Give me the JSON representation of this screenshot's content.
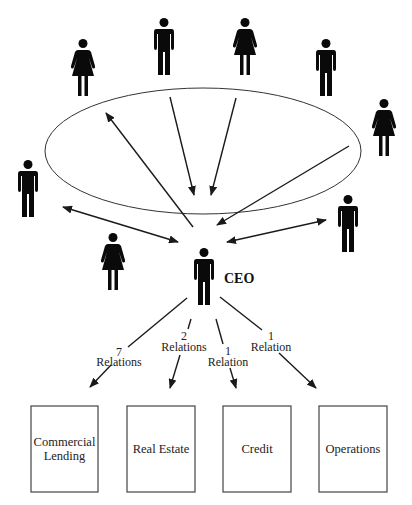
{
  "diagram": {
    "center_label": "CEO",
    "people": [
      {
        "id": "person-1",
        "type": "woman",
        "cx": 83,
        "top": 39
      },
      {
        "id": "person-2",
        "type": "man",
        "cx": 164,
        "top": 18
      },
      {
        "id": "person-3",
        "type": "woman",
        "cx": 245,
        "top": 18
      },
      {
        "id": "person-4",
        "type": "man",
        "cx": 326,
        "top": 39
      },
      {
        "id": "person-5",
        "type": "woman",
        "cx": 384,
        "top": 99
      },
      {
        "id": "person-6",
        "type": "man",
        "cx": 28,
        "top": 160
      },
      {
        "id": "person-7",
        "type": "woman",
        "cx": 113,
        "top": 233
      },
      {
        "id": "person-8",
        "type": "man",
        "cx": 348,
        "top": 195
      },
      {
        "id": "ceo",
        "type": "man",
        "cx": 204,
        "top": 246
      }
    ],
    "relations": [
      {
        "count": "7",
        "label": "Relations",
        "target": "Commercial Lending"
      },
      {
        "count": "2",
        "label": "Relations",
        "target": "Real Estate"
      },
      {
        "count": "1",
        "label": "Relation",
        "target": "Credit"
      },
      {
        "count": "1",
        "label": "Relation",
        "target": "Operations"
      }
    ],
    "departments": [
      {
        "line1": "Commercial",
        "line2": "Lending"
      },
      {
        "line1": "Real Estate",
        "line2": ""
      },
      {
        "line1": "Credit",
        "line2": ""
      },
      {
        "line1": "Operations",
        "line2": ""
      }
    ],
    "colors": {
      "ink": "#0a0a0a",
      "line": "#1a1a1a",
      "background": "#ffffff"
    }
  }
}
